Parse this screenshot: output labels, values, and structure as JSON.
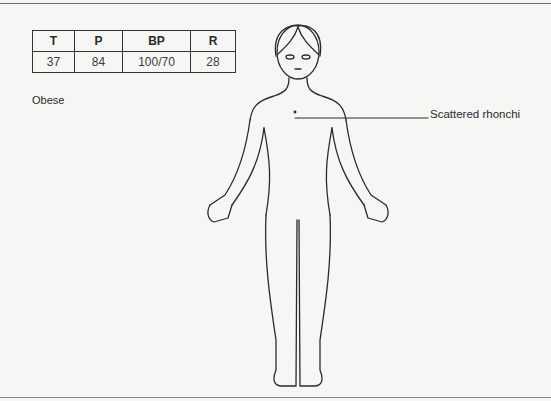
{
  "vitals": {
    "headers": [
      "T",
      "P",
      "BP",
      "R"
    ],
    "values": [
      "37",
      "84",
      "100/70",
      "28"
    ]
  },
  "notes": {
    "habitus": "Obese"
  },
  "findings": [
    {
      "label": "Scattered rhonchi",
      "location": "chest"
    }
  ],
  "figure": {
    "type": "body-outline",
    "view": "anterior"
  },
  "colors": {
    "line": "#2b2b2b",
    "background": "#f6f6f4"
  }
}
